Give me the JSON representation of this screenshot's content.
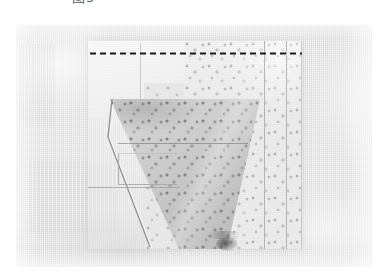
{
  "figure": {
    "caption": "图5",
    "caption_note": "figure number label, clipped at top edge",
    "alt": "Photograph of a flat-laid textile / garment piece on a pale woven cloth background"
  },
  "photo": {
    "label": "fabric-photograph",
    "background_color": "#e8e8e8",
    "frame": {
      "left": 16,
      "top": 25,
      "width": 356,
      "height": 242
    },
    "regions": [
      {
        "name": "background-cloth",
        "description": "pale grey woven cotton backdrop",
        "color": "#e8e8e8"
      },
      {
        "name": "plain-panel",
        "description": "light unpatterned fabric panel, upper left of the piece",
        "color": "#f4f4f4"
      },
      {
        "name": "printed-panel",
        "description": "speckled dotted print fabric panel with vertical seams",
        "color": "#ececec"
      },
      {
        "name": "folded-flap",
        "description": "darker triangular folded-over flap",
        "color": "#d2d2d2"
      },
      {
        "name": "pocket-outline",
        "description": "small rectangular stitched pocket outline",
        "color": "#a8a8a8"
      },
      {
        "name": "dark-smudge",
        "description": "dark mark near the lower tip of the fold",
        "color": "#3c3c3c"
      }
    ],
    "seams": {
      "count": 3,
      "orientation": "vertical",
      "color": "#a8a8a8"
    }
  },
  "annotation": {
    "dashed_line": {
      "name": "dashed-guide-line",
      "description": "horizontal black dashed marking line across the top of the piece",
      "color": "#1a1a1a",
      "dash": "6 4",
      "stroke_width": 2,
      "x_start": 74,
      "x_end": 286,
      "y": 28
    }
  }
}
